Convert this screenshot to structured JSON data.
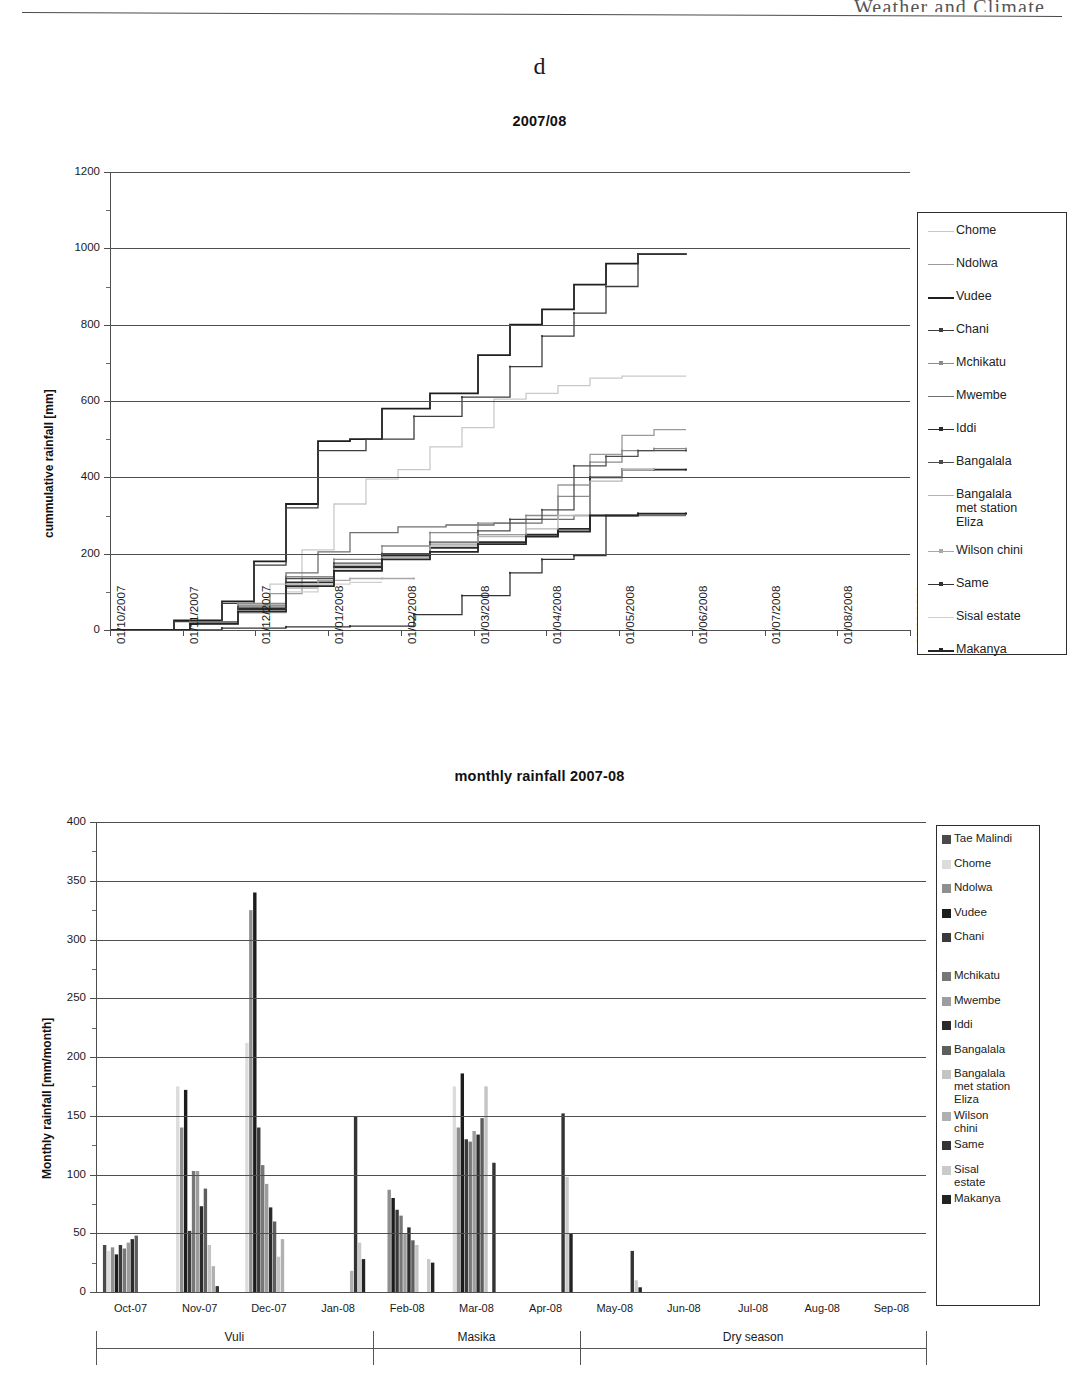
{
  "page": {
    "running_header": "Weather and Climate",
    "panel_letter": "d"
  },
  "chart_data": [
    {
      "id": "cumulative-rainfall-2007-08",
      "type": "line",
      "title": "2007/08",
      "xlabel": "",
      "ylabel": "cummulative rainfall [mm]",
      "ylim": [
        0,
        1200
      ],
      "yticks": [
        0,
        200,
        400,
        600,
        800,
        1000,
        1200
      ],
      "xticks": [
        "01/10/2007",
        "01/11/2007",
        "01/12/2007",
        "01/01/2008",
        "01/02/2008",
        "01/03/2008",
        "01/04/2008",
        "01/05/2008",
        "01/06/2008",
        "01/07/2008",
        "01/08/2008",
        "01/09/2008"
      ],
      "grid": true,
      "legend_position": "right",
      "series": [
        {
          "name": "Chome",
          "color": "#c9c9c9",
          "marker": "none",
          "x": [
            0.0,
            0.1,
            0.16,
            0.2,
            0.24,
            0.28,
            0.32,
            0.36,
            0.4,
            0.44,
            0.48,
            0.52,
            0.56,
            0.6,
            0.64,
            0.68,
            0.72
          ],
          "y": [
            0,
            20,
            60,
            120,
            210,
            330,
            395,
            420,
            480,
            530,
            605,
            620,
            640,
            660,
            665,
            665,
            665
          ]
        },
        {
          "name": "Ndolwa",
          "color": "#9a9a9a",
          "marker": "none",
          "x": [
            0.0,
            0.1,
            0.16,
            0.2,
            0.24,
            0.28,
            0.34,
            0.4,
            0.46,
            0.52,
            0.56,
            0.6,
            0.64,
            0.68,
            0.72
          ],
          "y": [
            0,
            18,
            45,
            95,
            140,
            170,
            195,
            225,
            250,
            290,
            380,
            460,
            510,
            525,
            525
          ]
        },
        {
          "name": "Vudee",
          "color": "#1f1f1f",
          "marker": "none",
          "x": [
            0.0,
            0.08,
            0.14,
            0.18,
            0.22,
            0.26,
            0.3,
            0.34,
            0.4,
            0.46,
            0.5,
            0.54,
            0.58,
            0.62,
            0.66,
            0.72
          ],
          "y": [
            0,
            25,
            75,
            180,
            330,
            495,
            500,
            580,
            620,
            720,
            800,
            840,
            905,
            960,
            985,
            985
          ]
        },
        {
          "name": "Chani",
          "color": "#3d3d3d",
          "marker": "dot",
          "x": [
            0.0,
            0.08,
            0.14,
            0.18,
            0.22,
            0.26,
            0.32,
            0.38,
            0.44,
            0.5,
            0.54,
            0.58,
            0.62,
            0.66,
            0.72
          ],
          "y": [
            0,
            22,
            70,
            170,
            320,
            470,
            500,
            560,
            610,
            690,
            770,
            830,
            900,
            985,
            985
          ]
        },
        {
          "name": "Mchikatu",
          "color": "#8c8c8c",
          "marker": "dot",
          "x": [
            0.0,
            0.1,
            0.16,
            0.22,
            0.28,
            0.34,
            0.4,
            0.46,
            0.52,
            0.56,
            0.6,
            0.64,
            0.68,
            0.72
          ],
          "y": [
            0,
            22,
            70,
            140,
            185,
            220,
            255,
            280,
            300,
            350,
            440,
            470,
            475,
            475
          ]
        },
        {
          "name": "Mwembe",
          "color": "#6f6f6f",
          "marker": "none",
          "x": [
            0.0,
            0.1,
            0.16,
            0.22,
            0.26,
            0.3,
            0.36,
            0.42,
            0.48,
            0.54,
            0.58,
            0.62,
            0.66,
            0.72
          ],
          "y": [
            0,
            20,
            65,
            150,
            205,
            255,
            270,
            275,
            280,
            290,
            300,
            300,
            300,
            300
          ]
        },
        {
          "name": "Iddi",
          "color": "#2a2a2a",
          "marker": "dot",
          "x": [
            0.0,
            0.1,
            0.16,
            0.22,
            0.28,
            0.34,
            0.4,
            0.46,
            0.52,
            0.56,
            0.6,
            0.64,
            0.68,
            0.72
          ],
          "y": [
            0,
            18,
            55,
            125,
            165,
            195,
            215,
            230,
            250,
            265,
            400,
            420,
            420,
            420
          ]
        },
        {
          "name": "Bangalala",
          "color": "#4d4d4d",
          "marker": "dot",
          "x": [
            0.0,
            0.1,
            0.16,
            0.22,
            0.28,
            0.34,
            0.4,
            0.46,
            0.5,
            0.54,
            0.58,
            0.62,
            0.66,
            0.72
          ],
          "y": [
            0,
            20,
            60,
            135,
            175,
            200,
            230,
            260,
            290,
            315,
            430,
            455,
            470,
            470
          ]
        },
        {
          "name": "Bangalala\nmet station\nEliza",
          "color": "#b5b5b5",
          "marker": "none",
          "x": [
            0.0,
            0.1,
            0.16,
            0.22,
            0.28,
            0.34,
            0.4,
            0.46,
            0.52,
            0.56,
            0.6,
            0.64,
            0.68
          ],
          "y": [
            0,
            15,
            50,
            120,
            160,
            190,
            220,
            245,
            265,
            300,
            390,
            420,
            425
          ]
        },
        {
          "name": "Wilson chini",
          "color": "#a8a8a8",
          "marker": "dot",
          "x": [
            0.0,
            0.1,
            0.16,
            0.22,
            0.26,
            0.3,
            0.34,
            0.38
          ],
          "y": [
            0,
            18,
            50,
            110,
            130,
            135,
            135,
            135
          ]
        },
        {
          "name": "Same",
          "color": "#333333",
          "marker": "dot",
          "x": [
            0.0,
            0.14,
            0.22,
            0.3,
            0.38,
            0.44,
            0.5,
            0.54,
            0.58,
            0.62,
            0.66,
            0.72
          ],
          "y": [
            0,
            5,
            8,
            10,
            40,
            90,
            150,
            185,
            195,
            300,
            305,
            305
          ]
        },
        {
          "name": "Sisal estate",
          "color": "#cfcfcf",
          "marker": "none",
          "x": [
            0.0,
            0.1,
            0.16,
            0.22,
            0.26,
            0.3,
            0.34
          ],
          "y": [
            0,
            15,
            45,
            100,
            120,
            125,
            125
          ]
        },
        {
          "name": "Makanya",
          "color": "#262626",
          "marker": "dot",
          "x": [
            0.0,
            0.1,
            0.16,
            0.22,
            0.28,
            0.34,
            0.4,
            0.46,
            0.52,
            0.56,
            0.6,
            0.66,
            0.72
          ],
          "y": [
            0,
            16,
            48,
            115,
            155,
            185,
            205,
            225,
            245,
            258,
            300,
            305,
            305
          ]
        }
      ]
    },
    {
      "id": "monthly-rainfall-2007-08",
      "type": "bar",
      "title": "monthly rainfall 2007-08",
      "xlabel": "",
      "ylabel": "Monthly rainfall [mm/month]",
      "ylim": [
        0,
        400
      ],
      "yticks": [
        0,
        50,
        100,
        150,
        200,
        250,
        300,
        350,
        400
      ],
      "categories": [
        "Oct-07",
        "Nov-07",
        "Dec-07",
        "Jan-08",
        "Feb-08",
        "Mar-08",
        "Apr-08",
        "May-08",
        "Jun-08",
        "Jul-08",
        "Aug-08",
        "Sep-08"
      ],
      "grid": true,
      "legend_position": "right",
      "series": [
        {
          "name": "Tae Malindi",
          "color": "#4a4a4a",
          "values": [
            40,
            0,
            0,
            0,
            0,
            0,
            0,
            0,
            0,
            0,
            0,
            0
          ]
        },
        {
          "name": "Chome",
          "color": "#dcdcdc",
          "values": [
            35,
            175,
            212,
            0,
            0,
            175,
            0,
            0,
            0,
            0,
            0,
            0
          ]
        },
        {
          "name": "Ndolwa",
          "color": "#8f8f8f",
          "values": [
            38,
            140,
            325,
            0,
            87,
            140,
            0,
            0,
            0,
            0,
            0,
            0
          ]
        },
        {
          "name": "Vudee",
          "color": "#1c1c1c",
          "values": [
            32,
            172,
            340,
            0,
            80,
            186,
            0,
            0,
            0,
            0,
            0,
            0
          ]
        },
        {
          "name": "Chani",
          "color": "#3a3a3a",
          "values": [
            40,
            52,
            140,
            0,
            70,
            130,
            0,
            0,
            0,
            0,
            0,
            0
          ]
        },
        {
          "name": "Mchikatu",
          "color": "#777777",
          "values": [
            37,
            103,
            108,
            0,
            65,
            128,
            0,
            0,
            0,
            0,
            0,
            0
          ]
        },
        {
          "name": "Mwembe",
          "color": "#9d9d9d",
          "values": [
            42,
            103,
            92,
            0,
            50,
            137,
            0,
            0,
            0,
            0,
            0,
            0
          ]
        },
        {
          "name": "Iddi",
          "color": "#2b2b2b",
          "values": [
            45,
            73,
            72,
            0,
            55,
            134,
            0,
            0,
            0,
            0,
            0,
            0
          ]
        },
        {
          "name": "Bangalala",
          "color": "#5e5e5e",
          "values": [
            48,
            88,
            60,
            0,
            44,
            148,
            0,
            0,
            0,
            0,
            0,
            0
          ]
        },
        {
          "name": "Bangalala\nmet station\nEliza",
          "color": "#c4c4c4",
          "values": [
            0,
            40,
            30,
            0,
            40,
            175,
            0,
            0,
            0,
            0,
            0,
            0
          ]
        },
        {
          "name": "Wilson\nchini",
          "color": "#b0b0b0",
          "values": [
            0,
            22,
            45,
            18,
            0,
            0,
            0,
            0,
            0,
            0,
            0,
            0
          ]
        },
        {
          "name": "Same",
          "color": "#343434",
          "values": [
            0,
            5,
            0,
            149,
            0,
            110,
            152,
            35,
            0,
            0,
            0,
            0
          ]
        },
        {
          "name": "Sisal\nestate",
          "color": "#cacaca",
          "values": [
            0,
            0,
            0,
            42,
            28,
            0,
            98,
            10,
            0,
            0,
            0,
            0
          ]
        },
        {
          "name": "Makanya",
          "color": "#232323",
          "values": [
            0,
            0,
            0,
            28,
            25,
            0,
            50,
            4,
            0,
            0,
            0,
            0
          ]
        }
      ],
      "season_bands": [
        {
          "label": "Vuli",
          "start": 0,
          "end": 4
        },
        {
          "label": "Masika",
          "start": 4,
          "end": 7
        },
        {
          "label": "Dry season",
          "start": 7,
          "end": 12
        }
      ]
    }
  ]
}
